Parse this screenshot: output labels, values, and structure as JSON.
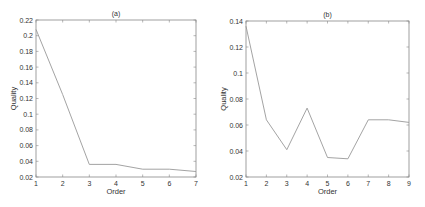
{
  "chart_data": [
    {
      "type": "line",
      "title": "(a)",
      "xlabel": "Order",
      "ylabel": "Quality",
      "x": [
        1,
        2,
        3,
        4,
        5,
        6,
        7
      ],
      "series": [
        {
          "name": "Quality",
          "values": [
            0.208,
            0.125,
            0.036,
            0.036,
            0.03,
            0.03,
            0.027
          ]
        }
      ],
      "xlim": [
        1,
        7
      ],
      "ylim": [
        0.02,
        0.22
      ],
      "xticks": [
        "1",
        "2",
        "3",
        "4",
        "5",
        "6",
        "7"
      ],
      "yticks": [
        "0.02",
        "0.04",
        "0.06",
        "0.08",
        "0.1",
        "0.12",
        "0.14",
        "0.16",
        "0.18",
        "0.2",
        "0.22"
      ],
      "grid": false,
      "legend": null,
      "color": "#999999"
    },
    {
      "type": "line",
      "title": "(b)",
      "xlabel": "Order",
      "ylabel": "Quality",
      "x": [
        1,
        2,
        3,
        4,
        5,
        6,
        7,
        8,
        9
      ],
      "series": [
        {
          "name": "Quality",
          "values": [
            0.136,
            0.064,
            0.041,
            0.073,
            0.035,
            0.034,
            0.064,
            0.064,
            0.062
          ]
        }
      ],
      "xlim": [
        1,
        9
      ],
      "ylim": [
        0.02,
        0.14
      ],
      "xticks": [
        "1",
        "2",
        "3",
        "4",
        "5",
        "6",
        "7",
        "8",
        "9"
      ],
      "yticks": [
        "0.02",
        "0.04",
        "0.06",
        "0.08",
        "0.1",
        "0.12",
        "0.14"
      ],
      "grid": false,
      "legend": null,
      "color": "#999999"
    }
  ]
}
